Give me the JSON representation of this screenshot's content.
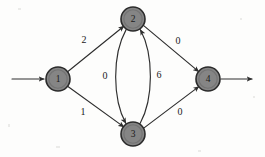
{
  "figure": {
    "kind": "directed-weighted-graph",
    "background_color": "#fdfdfc",
    "node_fill_color": "#858585",
    "node_stroke_color": "#2b2b2b",
    "edge_color": "#2e2e2e",
    "label_color": "#1a1a1a"
  },
  "nodes": [
    {
      "id": "1",
      "label": "1",
      "cx": 58,
      "cy": 79,
      "r": 12
    },
    {
      "id": "2",
      "label": "2",
      "cx": 133,
      "cy": 19,
      "r": 12
    },
    {
      "id": "3",
      "label": "3",
      "cx": 133,
      "cy": 134,
      "r": 12
    },
    {
      "id": "4",
      "label": "4",
      "cx": 208,
      "cy": 79,
      "r": 12
    }
  ],
  "edges": [
    {
      "id": "e-1-2",
      "from": "1",
      "to": "2",
      "weight": "2",
      "label_x": 84,
      "label_y": 39
    },
    {
      "id": "e-1-3",
      "from": "1",
      "to": "3",
      "weight": "1",
      "label_x": 83,
      "label_y": 111
    },
    {
      "id": "e-2-3",
      "from": "2",
      "to": "3",
      "weight": "0",
      "label_x": 105,
      "label_y": 75
    },
    {
      "id": "e-3-2",
      "from": "3",
      "to": "2",
      "weight": "6",
      "label_x": 159,
      "label_y": 74
    },
    {
      "id": "e-2-4",
      "from": "2",
      "to": "4",
      "weight": "0",
      "label_x": 178,
      "label_y": 40
    },
    {
      "id": "e-3-4",
      "from": "3",
      "to": "4",
      "weight": "0",
      "label_x": 180,
      "label_y": 111
    }
  ],
  "terminals": {
    "entry_arrow": {
      "id": "entry-arrow",
      "label": "",
      "from_x": 12,
      "to_x": 44,
      "y": 79
    },
    "exit_arrow": {
      "id": "exit-arrow",
      "label": "",
      "from_x": 221,
      "to_x": 252,
      "y": 79
    }
  }
}
